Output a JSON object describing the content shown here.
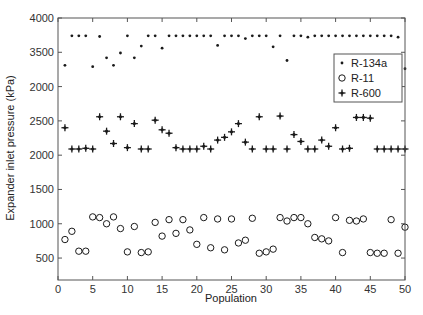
{
  "chart_data": {
    "type": "scatter",
    "title": "",
    "xlabel": "Population",
    "ylabel": "Expander inlet pressure (kPa)",
    "xlim": [
      0,
      50
    ],
    "ylim": [
      180,
      4000
    ],
    "grid": false,
    "legend_position": "upper right (inset)",
    "x_ticks": [
      0,
      5,
      10,
      15,
      20,
      25,
      30,
      35,
      40,
      45,
      50
    ],
    "x_tick_labels": [
      "0",
      "5",
      "10",
      "15",
      "20",
      "25",
      "30",
      "35",
      "40",
      "45",
      "50"
    ],
    "y_ticks": [
      500,
      1000,
      1500,
      2000,
      2500,
      3000,
      3500,
      4000
    ],
    "y_tick_labels": [
      "500",
      "1000",
      "1500",
      "2000",
      "2500",
      "2000",
      "3500",
      "4000"
    ],
    "x": [
      1,
      2,
      3,
      4,
      5,
      6,
      7,
      8,
      9,
      10,
      11,
      12,
      13,
      14,
      15,
      16,
      17,
      18,
      19,
      20,
      21,
      22,
      23,
      24,
      25,
      26,
      27,
      28,
      29,
      30,
      31,
      32,
      33,
      34,
      35,
      36,
      37,
      38,
      39,
      40,
      41,
      42,
      43,
      44,
      45,
      46,
      47,
      48,
      49,
      50
    ],
    "series": [
      {
        "name": "R-134a",
        "marker": "dot",
        "values": [
          3310,
          3740,
          3740,
          3740,
          3290,
          3730,
          3420,
          3310,
          3490,
          3740,
          3420,
          3590,
          3740,
          3740,
          3560,
          3740,
          3740,
          3740,
          3740,
          3740,
          3740,
          3740,
          3600,
          3740,
          3740,
          3740,
          3700,
          3740,
          3740,
          3740,
          3580,
          3740,
          3380,
          3740,
          3740,
          3720,
          3740,
          3740,
          3740,
          3740,
          3740,
          3740,
          3740,
          3740,
          3740,
          3740,
          3740,
          3740,
          3720,
          3260
        ]
      },
      {
        "name": "R-11",
        "marker": "circle",
        "values": [
          770,
          890,
          600,
          600,
          1100,
          1090,
          1000,
          1100,
          930,
          590,
          960,
          580,
          590,
          1020,
          820,
          1060,
          860,
          1060,
          910,
          700,
          1090,
          650,
          1070,
          620,
          1070,
          720,
          760,
          1080,
          570,
          590,
          630,
          1090,
          1040,
          1090,
          1090,
          1000,
          800,
          780,
          750,
          1090,
          580,
          1050,
          1040,
          1070,
          580,
          570,
          570,
          1060,
          570,
          950
        ]
      },
      {
        "name": "R-600",
        "marker": "plus",
        "values": [
          2400,
          2090,
          2090,
          2100,
          2090,
          2560,
          2350,
          2170,
          2560,
          2110,
          2460,
          2090,
          2090,
          2510,
          2370,
          2320,
          2110,
          2090,
          2090,
          2090,
          2130,
          2090,
          2220,
          2260,
          2340,
          2460,
          2190,
          2090,
          2560,
          2090,
          2090,
          2570,
          2090,
          2300,
          2200,
          2090,
          2090,
          2220,
          2130,
          2400,
          2090,
          2100,
          2550,
          2550,
          2540,
          2090,
          2090,
          2090,
          2090,
          2090
        ]
      }
    ]
  },
  "legend": {
    "items": [
      {
        "label": "R-134a",
        "marker": "dot"
      },
      {
        "label": "R-11",
        "marker": "circle"
      },
      {
        "label": "R-600",
        "marker": "plus"
      }
    ]
  },
  "axes": {
    "xlabel": "Population",
    "ylabel": "Expander inlet pressure (kPa)"
  },
  "colors": {
    "marker": "#1a1a1a",
    "axis": "#555555",
    "background": "#ffffff"
  }
}
